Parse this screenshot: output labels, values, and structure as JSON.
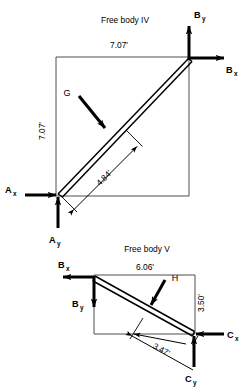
{
  "figure": {
    "background_color": "#ffffff",
    "ink_color": "#000000",
    "outline_color": "#3b3b3b"
  },
  "free_body_iv": {
    "title": "Free body IV",
    "dimension_top": "7.07'",
    "dimension_left": "7.07'",
    "dimension_diagonal": "4.84'",
    "load_label": "G",
    "forces": [
      {
        "name": "B-y",
        "label_main": "B",
        "label_sub": "y",
        "direction": "up"
      },
      {
        "name": "B-x",
        "label_main": "B",
        "label_sub": "x",
        "direction": "right"
      },
      {
        "name": "A-x",
        "label_main": "A",
        "label_sub": "x",
        "direction": "right"
      },
      {
        "name": "A-y",
        "label_main": "A",
        "label_sub": "y",
        "direction": "up"
      }
    ]
  },
  "free_body_v": {
    "title": "Free body V",
    "dimension_top": "6.06'",
    "dimension_right": "3.50'",
    "dimension_diagonal": "3.47'",
    "load_label": "H",
    "forces": [
      {
        "name": "B-x",
        "label_main": "B",
        "label_sub": "x",
        "direction": "left"
      },
      {
        "name": "B-y",
        "label_main": "B",
        "label_sub": "y",
        "direction": "down"
      },
      {
        "name": "C-x",
        "label_main": "C",
        "label_sub": "x",
        "direction": "left"
      },
      {
        "name": "C-y",
        "label_main": "C",
        "label_sub": "y",
        "direction": "up"
      }
    ]
  }
}
